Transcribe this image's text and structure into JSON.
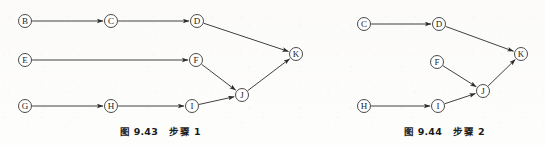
{
  "page": {
    "width": 545,
    "height": 145,
    "background_color": "#fdfdfc",
    "ink_color": "#2b2b2b"
  },
  "figures": [
    {
      "id": "figure-1",
      "caption_number": "图 9.43",
      "caption_step": "步骤 1",
      "nodes": [
        {
          "id": "B",
          "label": "B",
          "x": 25,
          "y": 21
        },
        {
          "id": "C",
          "label": "C",
          "x": 111,
          "y": 21
        },
        {
          "id": "D",
          "label": "D",
          "x": 197,
          "y": 21
        },
        {
          "id": "E",
          "label": "E",
          "x": 25,
          "y": 60
        },
        {
          "id": "F",
          "label": "F",
          "x": 196,
          "y": 60
        },
        {
          "id": "G",
          "label": "G",
          "x": 25,
          "y": 106
        },
        {
          "id": "H",
          "label": "H",
          "x": 111,
          "y": 106
        },
        {
          "id": "I",
          "label": "I",
          "x": 192,
          "y": 106
        },
        {
          "id": "J",
          "label": "J",
          "x": 242,
          "y": 95
        },
        {
          "id": "K",
          "label": "K",
          "x": 296,
          "y": 54
        }
      ],
      "edges": [
        {
          "from": "B",
          "to": "C"
        },
        {
          "from": "C",
          "to": "D"
        },
        {
          "from": "D",
          "to": "K"
        },
        {
          "from": "E",
          "to": "F"
        },
        {
          "from": "F",
          "to": "J"
        },
        {
          "from": "G",
          "to": "H"
        },
        {
          "from": "H",
          "to": "I"
        },
        {
          "from": "I",
          "to": "J"
        },
        {
          "from": "J",
          "to": "K"
        }
      ]
    },
    {
      "id": "figure-2",
      "caption_number": "图 9.44",
      "caption_step": "步骤 2",
      "nodes": [
        {
          "id": "C",
          "label": "C",
          "x": 364,
          "y": 24
        },
        {
          "id": "D",
          "label": "D",
          "x": 439,
          "y": 24
        },
        {
          "id": "F",
          "label": "F",
          "x": 437,
          "y": 62
        },
        {
          "id": "H",
          "label": "H",
          "x": 364,
          "y": 106
        },
        {
          "id": "I",
          "label": "I",
          "x": 438,
          "y": 106
        },
        {
          "id": "J",
          "label": "J",
          "x": 483,
          "y": 91
        },
        {
          "id": "K",
          "label": "K",
          "x": 521,
          "y": 54
        }
      ],
      "edges": [
        {
          "from": "C",
          "to": "D"
        },
        {
          "from": "D",
          "to": "K"
        },
        {
          "from": "F",
          "to": "J"
        },
        {
          "from": "H",
          "to": "I"
        },
        {
          "from": "I",
          "to": "J"
        },
        {
          "from": "J",
          "to": "K"
        }
      ]
    }
  ],
  "node_radius": 6.5
}
